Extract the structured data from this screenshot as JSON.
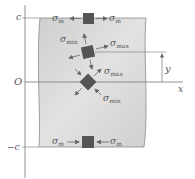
{
  "figure": {
    "type": "beam stress element diagram",
    "axes": {
      "vertical_labels": {
        "top": "c",
        "origin": "O",
        "bottom": "−c"
      },
      "horizontal_label": "x",
      "dimension_label": "y"
    },
    "elements": [
      {
        "position": "top",
        "orientation": "square",
        "stress_left": "σ",
        "sub_left": "m",
        "stress_right": "σ",
        "sub_right": "m",
        "direction": "outward"
      },
      {
        "position": "middle",
        "orientation": "tilted",
        "stress_a": "σ",
        "sub_a": "min",
        "stress_b": "σ",
        "sub_b": "max"
      },
      {
        "position": "neutral-axis",
        "orientation": "diamond",
        "stress_a": "σ",
        "sub_a": "max",
        "stress_b": "σ",
        "sub_b": "min"
      },
      {
        "position": "bottom",
        "orientation": "square",
        "stress_left": "σ",
        "sub_left": "m",
        "stress_right": "σ",
        "sub_right": "m",
        "direction": "inward"
      }
    ],
    "colors": {
      "beam_fill": "#d6d6d6",
      "beam_edge": "#8a8a8a",
      "element_fill": "#555555",
      "axis": "#777777",
      "arrow": "#666666"
    }
  }
}
